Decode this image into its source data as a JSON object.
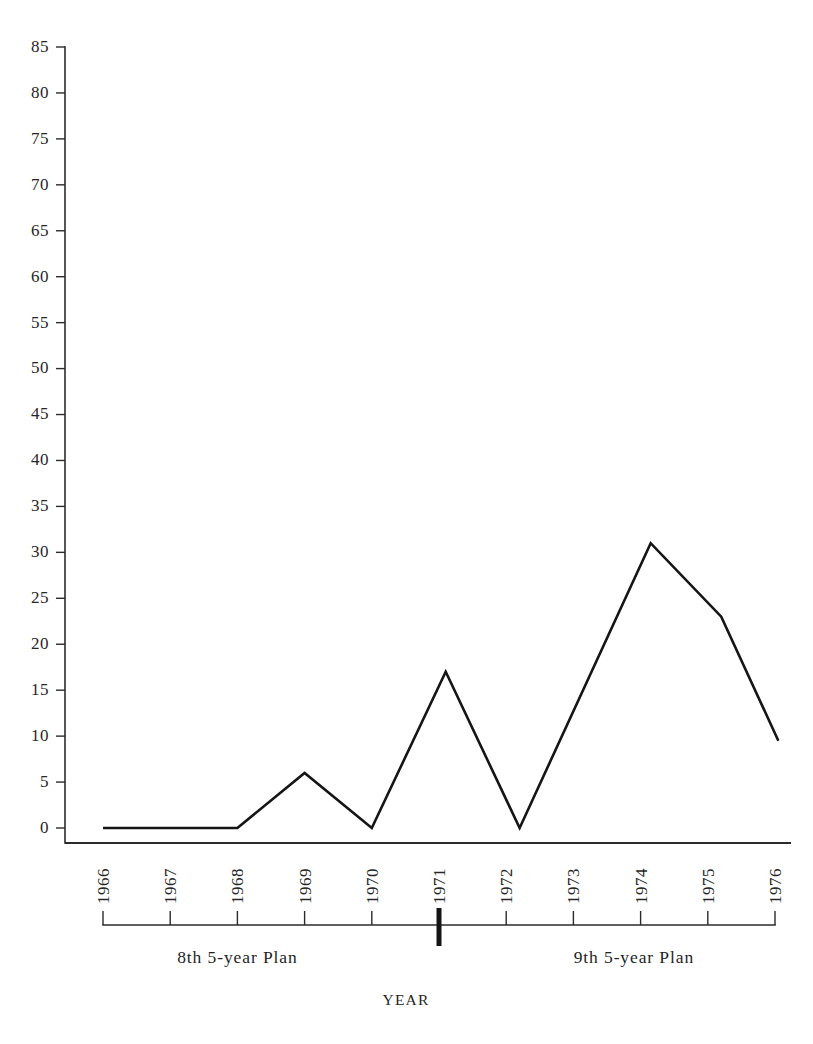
{
  "chart_data": {
    "type": "line",
    "title": "",
    "subtitle": "",
    "xlabel": "YEAR",
    "ylabel": "",
    "x": [
      1966,
      1967,
      1968,
      1969,
      1970,
      1971,
      1972,
      1973,
      1974,
      1975,
      1976
    ],
    "categories": [
      "1966",
      "1967",
      "1968",
      "1969",
      "1970",
      "1971",
      "1972",
      "1973",
      "1974",
      "1975",
      "1976"
    ],
    "values": [
      0,
      0,
      0,
      6,
      0,
      17,
      0,
      15.5,
      31,
      23,
      9.5
    ],
    "series": [
      {
        "name": "series-1",
        "values": [
          0,
          0,
          0,
          6,
          0,
          17,
          0,
          15.5,
          31,
          23,
          9.5
        ]
      }
    ],
    "vertices": [
      {
        "x": 1966,
        "y": 0
      },
      {
        "x": 1968,
        "y": 0
      },
      {
        "x": 1969,
        "y": 6
      },
      {
        "x": 1970,
        "y": 0
      },
      {
        "x": 1971.1,
        "y": 17
      },
      {
        "x": 1972.2,
        "y": 0
      },
      {
        "x": 1974.15,
        "y": 31
      },
      {
        "x": 1975.2,
        "y": 23
      },
      {
        "x": 1976.05,
        "y": 9.5
      }
    ],
    "ylim": [
      0,
      85
    ],
    "xlim": [
      1966,
      1976
    ],
    "ytick_labels": [
      "0",
      "5",
      "10",
      "15",
      "20",
      "25",
      "30",
      "35",
      "40",
      "45",
      "50",
      "55",
      "60",
      "65",
      "70",
      "75",
      "80",
      "85"
    ],
    "ytick_values": [
      0,
      5,
      10,
      15,
      20,
      25,
      30,
      35,
      40,
      45,
      50,
      55,
      60,
      65,
      70,
      75,
      80,
      85
    ],
    "xtick_labels": [
      "1966",
      "1967",
      "1968",
      "1969",
      "1970",
      "1971",
      "1972",
      "1973",
      "1974",
      "1975",
      "1976"
    ],
    "grid": false,
    "legend": null,
    "legend_position": "none",
    "annotations": [
      {
        "name": "plan-8",
        "text": "8th 5-year Plan",
        "x_center": 1968.0
      },
      {
        "name": "plan-9",
        "text": "9th 5-year Plan",
        "x_center": 1973.9
      }
    ],
    "plan_divider_year": 1971,
    "line_color": "#151515",
    "axis_color": "#2b2b2b",
    "background_color": "#ffffff"
  },
  "axis": {
    "x_title": "YEAR"
  },
  "plans": {
    "left_label": "8th 5-year Plan",
    "right_label": "9th 5-year Plan"
  }
}
